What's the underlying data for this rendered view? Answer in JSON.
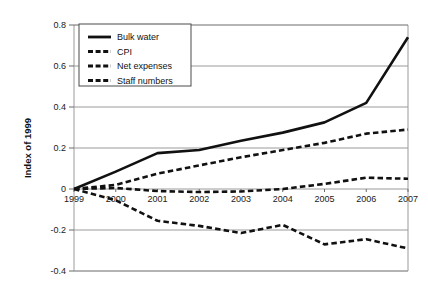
{
  "chart_data": {
    "type": "line",
    "title": "",
    "xlabel": "",
    "ylabel": "Index of 1999",
    "x": [
      1999,
      2000,
      2001,
      2002,
      2003,
      2004,
      2005,
      2006,
      2007
    ],
    "xticklabels": [
      "1999",
      "2000",
      "2001",
      "2002",
      "2003",
      "2004",
      "2005",
      "2006",
      "2007"
    ],
    "yticklabels": [
      "0.8",
      "0.6",
      "0.4",
      "0.2",
      "0",
      "-0.2",
      "-0.4"
    ],
    "yticks": [
      0.8,
      0.6,
      0.4,
      0.2,
      0,
      -0.2,
      -0.4
    ],
    "ylim": [
      -0.4,
      0.8
    ],
    "xlim": [
      1999,
      2007
    ],
    "grid": true,
    "grid_axis": "y",
    "legend_position": "top-left",
    "series": [
      {
        "name": "Bulk water",
        "style": "solid",
        "color": "#111111",
        "values": [
          0.0,
          0.085,
          0.175,
          0.19,
          0.235,
          0.275,
          0.325,
          0.42,
          0.74
        ]
      },
      {
        "name": "CPI",
        "style": "dashed",
        "color": "#111111",
        "values": [
          0.0,
          0.02,
          0.075,
          0.115,
          0.155,
          0.19,
          0.225,
          0.27,
          0.29
        ]
      },
      {
        "name": "Net expenses",
        "style": "dashed",
        "color": "#111111",
        "values": [
          0.0,
          0.005,
          -0.01,
          -0.015,
          -0.012,
          0.0,
          0.025,
          0.055,
          0.05
        ]
      },
      {
        "name": "Staff numbers",
        "style": "dashed",
        "color": "#111111",
        "values": [
          0.0,
          -0.055,
          -0.155,
          -0.18,
          -0.215,
          -0.175,
          -0.27,
          -0.245,
          -0.29
        ]
      }
    ]
  },
  "axis": {
    "ylabel": "Index of 1999"
  },
  "legend": {
    "items": [
      {
        "label": "Bulk water"
      },
      {
        "label": "CPI"
      },
      {
        "label": "Net expenses"
      },
      {
        "label": "Staff numbers"
      }
    ]
  }
}
